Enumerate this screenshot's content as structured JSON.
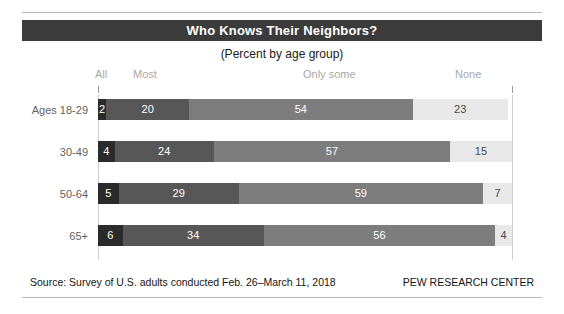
{
  "header": {
    "title": "Who Knows Their Neighbors?",
    "subtitle": "(Percent by age group)"
  },
  "footer": {
    "source": "Source: Survey of U.S. adults conducted Feb. 26–March 11, 2018",
    "brand": "PEW RESEARCH CENTER"
  },
  "colors": {
    "title_band": "#3b3b3b",
    "all": "#2b2b2b",
    "most": "#575757",
    "only_some": "#7d7d7d",
    "none": "#e8e8e8",
    "rule": "#b9b9b9",
    "legend_text": "#a8a8a8",
    "row_label_text": "#5f5f5f"
  },
  "chart_data": {
    "type": "bar",
    "title": "Who Knows Their Neighbors?",
    "subtitle": "(Percent by age group)",
    "xlabel": "",
    "ylabel": "",
    "xlim": [
      0,
      100
    ],
    "grid": false,
    "stacked": true,
    "orientation": "horizontal",
    "legend_position": "top",
    "categories": [
      "Ages 18-29",
      "30-49",
      "50-64",
      "65+"
    ],
    "series": [
      {
        "name": "All",
        "values": [
          2,
          4,
          5,
          6
        ]
      },
      {
        "name": "Most",
        "values": [
          20,
          24,
          29,
          34
        ]
      },
      {
        "name": "Only some",
        "values": [
          54,
          57,
          59,
          56
        ]
      },
      {
        "name": "None",
        "values": [
          23,
          15,
          7,
          4
        ]
      }
    ],
    "rows": [
      {
        "label": "Ages 18-29",
        "segments": [
          {
            "name": "All",
            "value": 2,
            "label": "2"
          },
          {
            "name": "Most",
            "value": 20,
            "label": "20"
          },
          {
            "name": "Only some",
            "value": 54,
            "label": "54"
          },
          {
            "name": "None",
            "value": 23,
            "label": "23"
          }
        ]
      },
      {
        "label": "30-49",
        "segments": [
          {
            "name": "All",
            "value": 4,
            "label": "4"
          },
          {
            "name": "Most",
            "value": 24,
            "label": "24"
          },
          {
            "name": "Only some",
            "value": 57,
            "label": "57"
          },
          {
            "name": "None",
            "value": 15,
            "label": "15"
          }
        ]
      },
      {
        "label": "50-64",
        "segments": [
          {
            "name": "All",
            "value": 5,
            "label": "5"
          },
          {
            "name": "Most",
            "value": 29,
            "label": "29"
          },
          {
            "name": "Only some",
            "value": 59,
            "label": "59"
          },
          {
            "name": "None",
            "value": 7,
            "label": "7"
          }
        ]
      },
      {
        "label": "65+",
        "segments": [
          {
            "name": "All",
            "value": 6,
            "label": "6"
          },
          {
            "name": "Most",
            "value": 34,
            "label": "34"
          },
          {
            "name": "Only some",
            "value": 56,
            "label": "56"
          },
          {
            "name": "None",
            "value": 4,
            "label": "4"
          }
        ]
      }
    ],
    "legend": [
      "All",
      "Most",
      "Only some",
      "None"
    ]
  }
}
